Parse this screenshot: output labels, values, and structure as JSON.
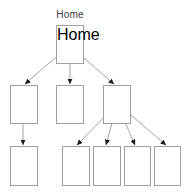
{
  "diagram": {
    "type": "site-map-tree",
    "title_label": "Home",
    "colors": {
      "box_border": "#a0a0a0",
      "box_fill": "#ffffff",
      "connector_line": "#8c8c8c",
      "arrow_head": "#1a1a1a",
      "label_text": "#3b3b3b",
      "canvas_background": "#ffffff"
    },
    "labels": {
      "root": "Home"
    },
    "nodes": [
      {
        "id": "root",
        "label": "Home",
        "level": 0,
        "x": 56,
        "y": 25,
        "w": 28,
        "h": 39
      },
      {
        "id": "child-1",
        "label": "",
        "level": 1,
        "x": 10,
        "y": 85,
        "w": 28,
        "h": 39
      },
      {
        "id": "child-2",
        "label": "",
        "level": 1,
        "x": 56,
        "y": 85,
        "w": 28,
        "h": 39
      },
      {
        "id": "child-3",
        "label": "",
        "level": 1,
        "x": 103,
        "y": 85,
        "w": 28,
        "h": 39
      },
      {
        "id": "leaf-1",
        "label": "",
        "level": 2,
        "x": 10,
        "y": 146,
        "w": 28,
        "h": 40
      },
      {
        "id": "leaf-2",
        "label": "",
        "level": 2,
        "x": 62,
        "y": 146,
        "w": 28,
        "h": 40
      },
      {
        "id": "leaf-3",
        "label": "",
        "level": 2,
        "x": 93,
        "y": 146,
        "w": 28,
        "h": 40
      },
      {
        "id": "leaf-4",
        "label": "",
        "level": 2,
        "x": 124,
        "y": 146,
        "w": 27,
        "h": 40
      },
      {
        "id": "leaf-5",
        "label": "",
        "level": 2,
        "x": 154,
        "y": 146,
        "w": 27,
        "h": 40
      }
    ],
    "edges": [
      {
        "from": "root",
        "to": "child-1",
        "x1": 69,
        "y1": 46,
        "x2": 25,
        "y2": 84
      },
      {
        "from": "root",
        "to": "child-2",
        "x1": 70,
        "y1": 46,
        "x2": 70,
        "y2": 84
      },
      {
        "from": "root",
        "to": "child-3",
        "x1": 70,
        "y1": 46,
        "x2": 114,
        "y2": 84
      },
      {
        "from": "child-1",
        "to": "leaf-1",
        "x1": 23,
        "y1": 100,
        "x2": 23,
        "y2": 145
      },
      {
        "from": "child-3",
        "to": "leaf-2",
        "x1": 117,
        "y1": 104,
        "x2": 77,
        "y2": 145
      },
      {
        "from": "child-3",
        "to": "leaf-3",
        "x1": 117,
        "y1": 104,
        "x2": 106,
        "y2": 145
      },
      {
        "from": "child-3",
        "to": "leaf-4",
        "x1": 117,
        "y1": 104,
        "x2": 135,
        "y2": 145
      },
      {
        "from": "child-3",
        "to": "leaf-5",
        "x1": 118,
        "y1": 104,
        "x2": 166,
        "y2": 145
      }
    ],
    "label_position": {
      "x": 56,
      "y": 9,
      "w": 28
    }
  }
}
